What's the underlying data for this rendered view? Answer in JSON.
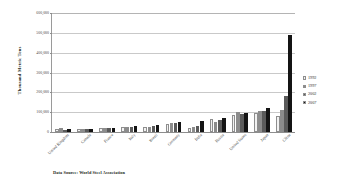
{
  "chart_data": {
    "type": "bar",
    "title": "",
    "xlabel": "",
    "ylabel": "Thousand Metric Tons",
    "ylim": [
      0,
      600000
    ],
    "ytick_values": [
      0,
      100000,
      200000,
      300000,
      400000,
      500000,
      600000
    ],
    "ytick_labels": [
      "0",
      "100,000",
      "200,000",
      "300,000",
      "400,000",
      "500,000",
      "600,000"
    ],
    "grid": true,
    "legend_position": "right",
    "categories": [
      "United Kingdom",
      "Canada",
      "France",
      "Italy",
      "Brazil",
      "Germany",
      "India",
      "Russia",
      "United States",
      "Japan",
      "China"
    ],
    "series": [
      {
        "name": "1992",
        "color": "#f2f2f2",
        "values": [
          16000,
          13900,
          18000,
          24800,
          23900,
          39700,
          18100,
          67000,
          84300,
          98100,
          80900
        ]
      },
      {
        "name": "1997",
        "color": "#8c8c8c",
        "values": [
          18500,
          15600,
          19800,
          25800,
          26200,
          45000,
          24400,
          48500,
          98500,
          104500,
          108900
        ]
      },
      {
        "name": "2002",
        "color": "#5b5b5b",
        "values": [
          11700,
          16000,
          20300,
          26100,
          29600,
          45000,
          28800,
          59800,
          91600,
          107700,
          182200
        ]
      },
      {
        "name": "2007",
        "color": "#141414",
        "values": [
          14300,
          15600,
          19300,
          31600,
          33800,
          48600,
          53100,
          72400,
          98100,
          120200,
          489000
        ]
      }
    ],
    "annotations": [
      "Data Source: World Steel Association"
    ]
  },
  "source_note": "Data Source: World Steel Association",
  "legend": {
    "items": [
      {
        "label": "1992",
        "color": "#f2f2f2"
      },
      {
        "label": "1997",
        "color": "#8c8c8c"
      },
      {
        "label": "2002",
        "color": "#5b5b5b"
      },
      {
        "label": "2007",
        "color": "#141414"
      }
    ]
  }
}
